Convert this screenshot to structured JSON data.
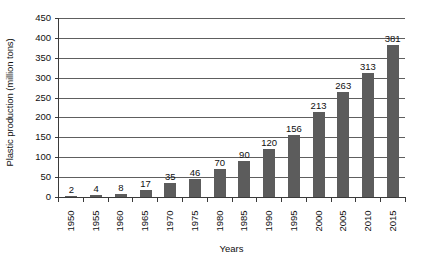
{
  "chart_data": {
    "type": "bar",
    "title": "",
    "xlabel": "Years",
    "ylabel": "Plastic production (million tons)",
    "categories": [
      "1950",
      "1955",
      "1960",
      "1965",
      "1970",
      "1975",
      "1980",
      "1985",
      "1990",
      "1995",
      "2000",
      "2005",
      "2010",
      "2015"
    ],
    "values": [
      2,
      4,
      8,
      17,
      35,
      46,
      70,
      90,
      120,
      156,
      213,
      263,
      313,
      381
    ],
    "value_labels": [
      "2",
      "4",
      "8",
      "17",
      "35",
      "46",
      "70",
      "90",
      "120",
      "156",
      "213",
      "263",
      "313",
      "381"
    ],
    "ylim": [
      0,
      450
    ],
    "ytick_values": [
      0,
      50,
      100,
      150,
      200,
      250,
      300,
      350,
      400,
      450
    ],
    "ytick_labels": [
      "0",
      "50",
      "100",
      "150",
      "200",
      "250",
      "300",
      "350",
      "400",
      "450"
    ],
    "grid": true,
    "legend": false,
    "bar_color": "#5c5c5c",
    "gridline_color": "#5e5e5e",
    "axis_color": "#3a3a3a",
    "background_color": "#ffffff",
    "xtick_label_rotation": 90
  }
}
